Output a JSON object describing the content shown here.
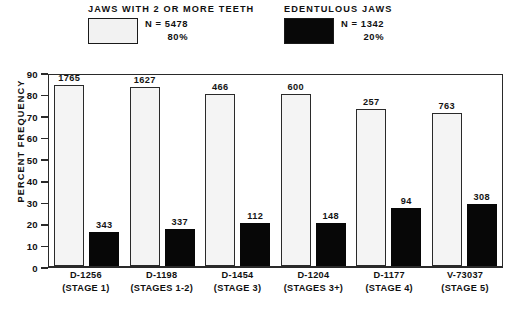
{
  "legend": {
    "left": {
      "title": "JAWS WITH 2 OR MORE TEETH",
      "swatch": "light-stippled-swatch",
      "n": "N = 5478",
      "percent": "80%"
    },
    "right": {
      "title": "EDENTULOUS JAWS",
      "swatch": "solid-black-swatch",
      "n": "N = 1342",
      "percent": "20%"
    }
  },
  "chart_data": {
    "type": "bar",
    "title": "",
    "xlabel": "",
    "ylabel": "PERCENT FREQUENCY",
    "ylim": [
      0,
      90
    ],
    "yticks": [
      0,
      10,
      20,
      30,
      40,
      50,
      60,
      70,
      80,
      90
    ],
    "grid": false,
    "legend_position": "top",
    "categories": [
      "D-1256",
      "D-1198",
      "D-1454",
      "D-1204",
      "D-1177",
      "V-73037"
    ],
    "category_sublabels": [
      "(STAGE 1)",
      "(STAGES 1-2)",
      "(STAGE 3)",
      "(STAGES 3+)",
      "(STAGE 4)",
      "(STAGE 5)"
    ],
    "series": [
      {
        "name": "JAWS WITH 2 OR MORE TEETH",
        "color": "#f4f4f4",
        "values": [
          84,
          83,
          80,
          80,
          73,
          71
        ],
        "labels": [
          "1765",
          "1627",
          "466",
          "600",
          "257",
          "763"
        ]
      },
      {
        "name": "EDENTULOUS JAWS",
        "color": "#070707",
        "values": [
          16,
          17,
          20,
          20,
          27,
          29
        ],
        "labels": [
          "343",
          "337",
          "112",
          "148",
          "94",
          "308"
        ]
      }
    ]
  }
}
